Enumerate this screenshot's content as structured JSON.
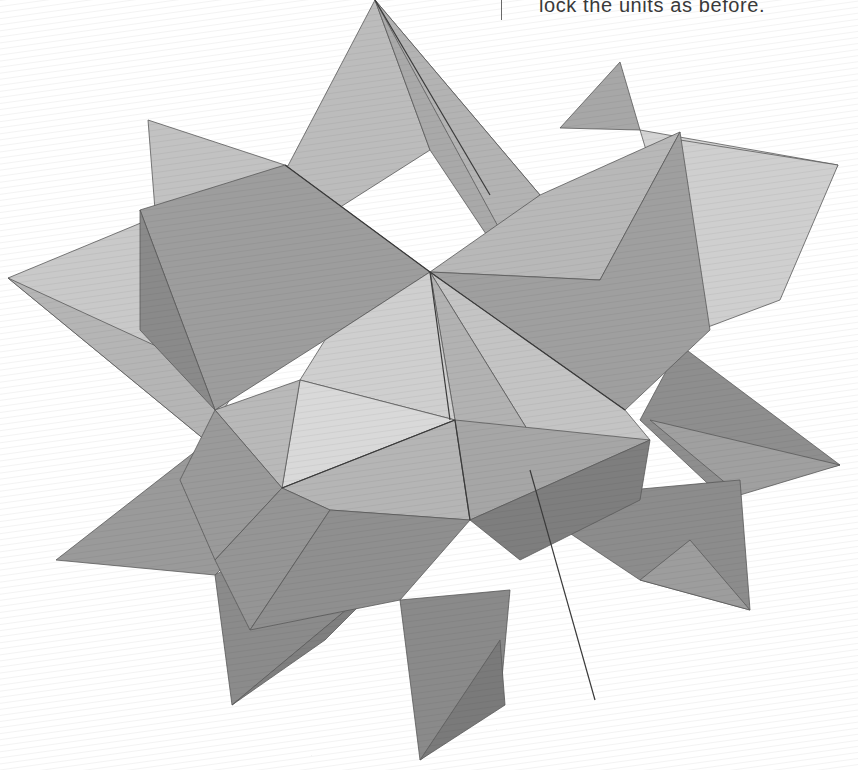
{
  "page": {
    "caption": "lock the units as before.",
    "background": "#ffffff",
    "text_color": "#3a3a3a"
  },
  "photo": {
    "subject": "origami-modular-star",
    "alt": "Photograph of a folded paper modular star (stellated polyhedron) made from grey ribbed paper"
  }
}
